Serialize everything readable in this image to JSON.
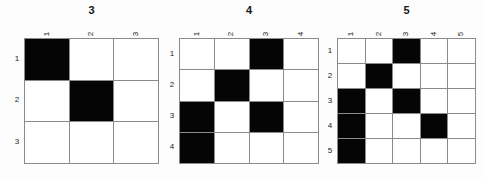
{
  "figure": {
    "background_color": "#fdfdfd",
    "grid_line_color": "#8a8a8a",
    "filled_cell_color": "#050505",
    "empty_cell_color": "#ffffff"
  },
  "panels": [
    {
      "title": "3",
      "size": 3,
      "column_labels": [
        "1",
        "2",
        "3"
      ],
      "row_labels": [
        "1",
        "2",
        "3"
      ],
      "filled_cells": [
        [
          1,
          1
        ],
        [
          2,
          2
        ]
      ],
      "matrix": [
        [
          1,
          0,
          0
        ],
        [
          0,
          1,
          0
        ],
        [
          0,
          0,
          0
        ]
      ]
    },
    {
      "title": "4",
      "size": 4,
      "column_labels": [
        "1",
        "2",
        "3",
        "4"
      ],
      "row_labels": [
        "1",
        "2",
        "3",
        "4"
      ],
      "filled_cells": [
        [
          1,
          3
        ],
        [
          2,
          2
        ],
        [
          3,
          1
        ],
        [
          3,
          3
        ],
        [
          4,
          1
        ]
      ],
      "matrix": [
        [
          0,
          0,
          1,
          0
        ],
        [
          0,
          1,
          0,
          0
        ],
        [
          1,
          0,
          1,
          0
        ],
        [
          1,
          0,
          0,
          0
        ]
      ]
    },
    {
      "title": "5",
      "size": 5,
      "column_labels": [
        "1",
        "2",
        "3",
        "4",
        "5"
      ],
      "row_labels": [
        "1",
        "2",
        "3",
        "4",
        "5"
      ],
      "filled_cells": [
        [
          1,
          3
        ],
        [
          2,
          2
        ],
        [
          3,
          1
        ],
        [
          3,
          3
        ],
        [
          4,
          1
        ],
        [
          4,
          4
        ],
        [
          5,
          1
        ]
      ],
      "matrix": [
        [
          0,
          0,
          1,
          0,
          0
        ],
        [
          0,
          1,
          0,
          0,
          0
        ],
        [
          1,
          0,
          1,
          0,
          0
        ],
        [
          1,
          0,
          0,
          1,
          0
        ],
        [
          1,
          0,
          0,
          0,
          0
        ]
      ]
    }
  ],
  "layout": {
    "panel_pixel_geometry": [
      {
        "grid_left": 24,
        "grid_right": 158,
        "grid_top": 40,
        "grid_bottom": 165
      },
      {
        "grid_left": 178,
        "grid_right": 317,
        "grid_top": 40,
        "grid_bottom": 165
      },
      {
        "grid_left": 335,
        "grid_right": 473,
        "grid_top": 40,
        "grid_bottom": 165
      }
    ]
  }
}
